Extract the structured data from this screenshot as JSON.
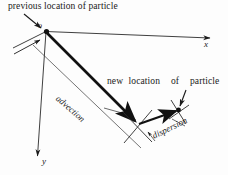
{
  "figure": {
    "type": "vector-diagram",
    "background_color": "#fdfdfd",
    "ink_color": "#1a1a1a",
    "labels": {
      "previous_location": "previous location of particle",
      "new_location": "new location  of  particle",
      "origin": "o",
      "x_axis": "x",
      "y_axis": "y",
      "advection": "advection",
      "dispersion": "dispersion"
    },
    "geometry": {
      "origin_point": [
        46,
        31
      ],
      "x_axis_end": [
        213,
        38
      ],
      "y_axis_end": [
        37,
        160
      ],
      "advection_end": [
        139,
        124
      ],
      "new_location_point": [
        179,
        110
      ]
    }
  }
}
